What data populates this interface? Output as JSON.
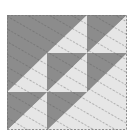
{
  "image": {
    "subject": "quilt-block",
    "description": "Half-square triangle quilt block with dashed quilting stitch lines",
    "grid": "3x3",
    "colors": {
      "dark": "#8c8c8c",
      "light": "#e6e6e6",
      "stitch": "#555555",
      "background": "#ffffff"
    }
  }
}
